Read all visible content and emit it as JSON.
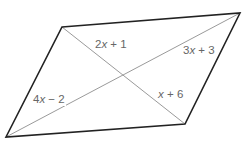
{
  "diagram": {
    "type": "parallelogram-with-diagonals",
    "colors": {
      "edge": "#222222",
      "diagonal": "#9a9a9a",
      "label": "#666666",
      "background": "#ffffff"
    },
    "vertices": {
      "top_left": [
        62,
        27
      ],
      "top_right": [
        240,
        13
      ],
      "bottom_right": [
        185,
        124
      ],
      "bottom_left": [
        6,
        137
      ]
    },
    "intersection": [
      124,
      76
    ],
    "labels": {
      "top_segment": {
        "coef": "2",
        "var": "x",
        "op": "+",
        "const": "1",
        "text": "2x + 1"
      },
      "right_segment": {
        "coef": "3",
        "var": "x",
        "op": "+",
        "const": "3",
        "text": "3x + 3"
      },
      "left_segment": {
        "coef": "4",
        "var": "x",
        "op": "−",
        "const": "2",
        "text": "4x − 2"
      },
      "bottom_segment": {
        "coef": "",
        "var": "x",
        "op": "+",
        "const": "6",
        "text": "x + 6"
      }
    }
  }
}
